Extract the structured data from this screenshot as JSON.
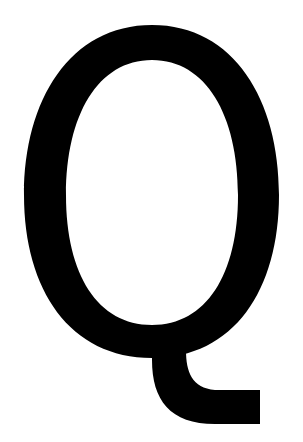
{
  "glyph": {
    "character": "Q",
    "color": "#000000",
    "background": "#ffffff"
  }
}
